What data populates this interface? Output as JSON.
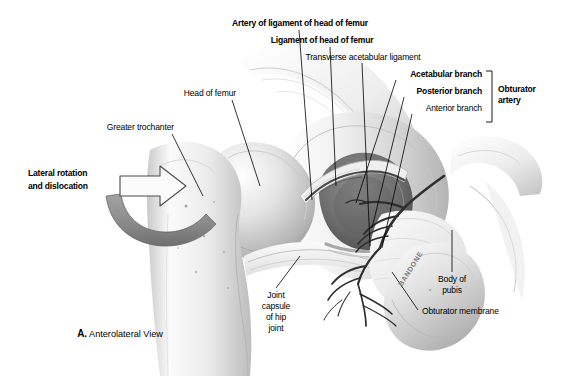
{
  "figure": {
    "caption_prefix": "A.",
    "caption_text": " Anterolateral View",
    "signature": "BANDONE",
    "background_color": "#ffffff",
    "ink_color": "#000000",
    "bone_light": "#f2f2f2",
    "bone_mid": "#d8d8d8",
    "bone_shadow": "#9a9a9a",
    "cavity_dark": "#6e6e6e",
    "vessel_color": "#3a3a3a",
    "arrow_color": "#8c8c8c"
  },
  "labels": {
    "artery_of_ligament": "Artery of ligament of head of femur",
    "ligament_of_head": "Ligament of head of femur",
    "transverse_acetabular": "Transverse acetabular ligament",
    "acetabular_branch": "Acetabular branch",
    "posterior_branch": "Posterior branch",
    "anterior_branch": "Anterior branch",
    "obturator_artery_line1": "Obturator",
    "obturator_artery_line2": "artery",
    "head_of_femur": "Head of femur",
    "greater_trochanter": "Greater trochanter",
    "lateral_rotation_line1": "Lateral rotation",
    "lateral_rotation_line2": "and dislocation",
    "joint_capsule_line1": "Joint",
    "joint_capsule_line2": "capsule",
    "joint_capsule_line3": "of hip",
    "joint_capsule_line4": "joint",
    "body_of_pubis_line1": "Body of",
    "body_of_pubis_line2": "pubis",
    "obturator_membrane": "Obturator membrane"
  }
}
